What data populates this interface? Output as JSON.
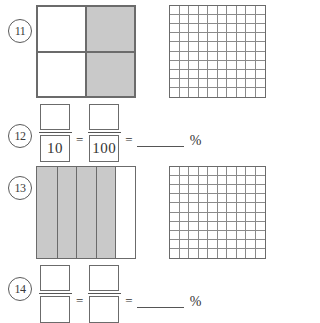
{
  "worksheet": {
    "title": "Fraction to Percent Models",
    "shade_color": "#c9c9c9",
    "line_color": "#6b6b6b"
  },
  "problems": [
    {
      "number": "11",
      "type": "model",
      "model": {
        "kind": "quarters-square",
        "rows": 2,
        "columns": 2,
        "total_parts": 4,
        "shaded_parts": 2,
        "fraction": "2/4",
        "shaded_cells": [
          1,
          3
        ]
      },
      "grid": {
        "kind": "hundred-grid",
        "rows": 10,
        "columns": 10,
        "total_cells": 100,
        "shaded_cells": 0
      }
    },
    {
      "number": "12",
      "type": "equation",
      "equation": {
        "numerator_1": "",
        "denominator_1": "10",
        "equals_1": "=",
        "numerator_2": "",
        "denominator_2": "100",
        "equals_2": "=",
        "answer_blank": "",
        "percent_symbol": "%"
      }
    },
    {
      "number": "13",
      "type": "model",
      "model": {
        "kind": "fifths-strips",
        "rows": 1,
        "columns": 5,
        "total_parts": 5,
        "shaded_parts": 4,
        "fraction": "4/5",
        "shaded_cells": [
          0,
          1,
          2,
          3
        ]
      },
      "grid": {
        "kind": "hundred-grid",
        "rows": 10,
        "columns": 10,
        "total_cells": 100,
        "shaded_cells": 0
      }
    },
    {
      "number": "14",
      "type": "equation",
      "equation": {
        "numerator_1": "",
        "denominator_1": "",
        "equals_1": "=",
        "numerator_2": "",
        "denominator_2": "",
        "equals_2": "=",
        "answer_blank": "",
        "percent_symbol": "%"
      }
    }
  ]
}
